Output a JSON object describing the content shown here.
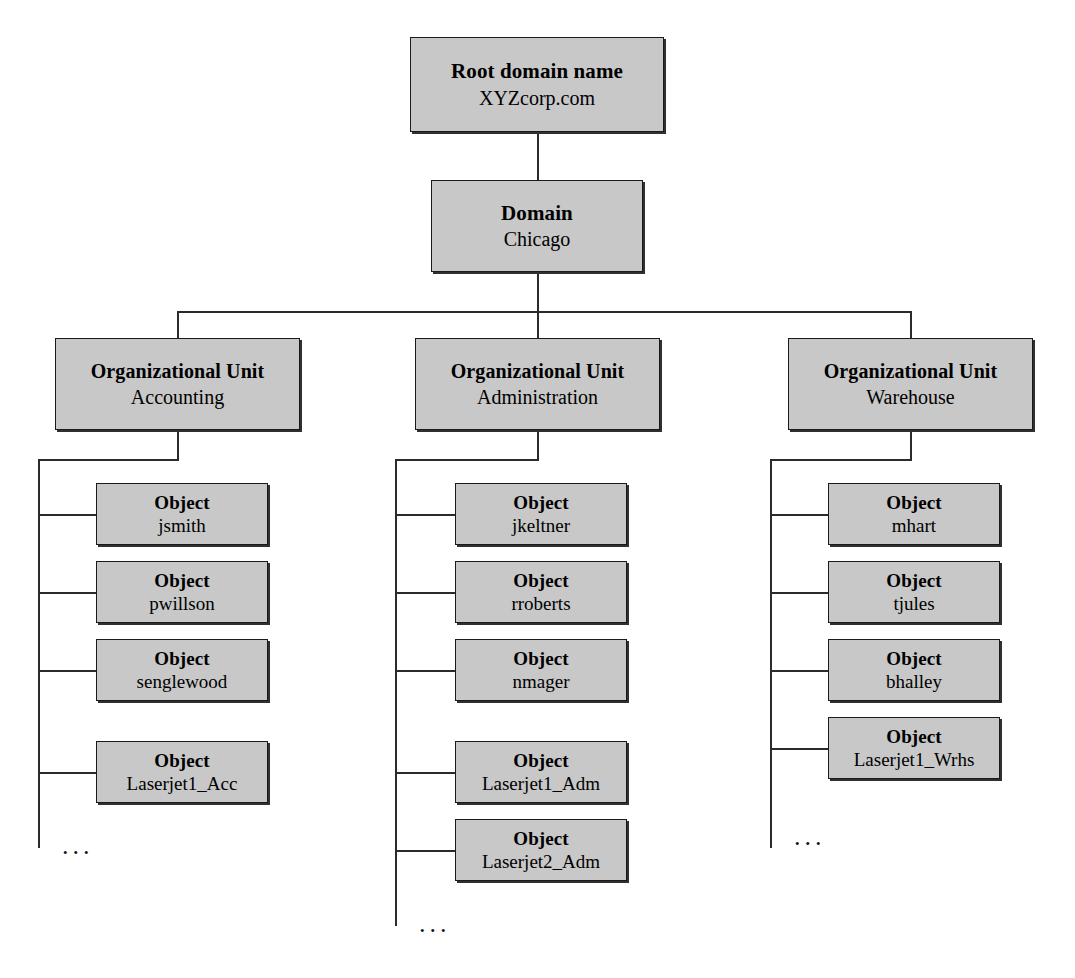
{
  "diagram": {
    "box_fill": "#c8c8c8",
    "box_border": "#1a1a1a",
    "line_color": "#2b2b2b",
    "ellipsis": "...",
    "root": {
      "label": "Root domain name",
      "value": "XYZcorp.com"
    },
    "domain": {
      "label": "Domain",
      "value": "Chicago"
    },
    "org_units": [
      {
        "label": "Organizational Unit",
        "value": "Accounting",
        "objects": [
          {
            "label": "Object",
            "value": "jsmith"
          },
          {
            "label": "Object",
            "value": "pwillson"
          },
          {
            "label": "Object",
            "value": "senglewood"
          },
          {
            "label": "Object",
            "value": "Laserjet1_Acc"
          }
        ]
      },
      {
        "label": "Organizational Unit",
        "value": "Administration",
        "objects": [
          {
            "label": "Object",
            "value": "jkeltner"
          },
          {
            "label": "Object",
            "value": "rroberts"
          },
          {
            "label": "Object",
            "value": "nmager"
          },
          {
            "label": "Object",
            "value": "Laserjet1_Adm"
          },
          {
            "label": "Object",
            "value": "Laserjet2_Adm"
          }
        ]
      },
      {
        "label": "Organizational Unit",
        "value": "Warehouse",
        "objects": [
          {
            "label": "Object",
            "value": "mhart"
          },
          {
            "label": "Object",
            "value": "tjules"
          },
          {
            "label": "Object",
            "value": "bhalley"
          },
          {
            "label": "Object",
            "value": "Laserjet1_Wrhs"
          }
        ]
      }
    ]
  }
}
